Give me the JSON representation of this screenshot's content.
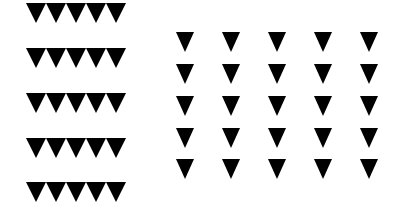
{
  "figure": {
    "background": "#ffffff",
    "shape": "downward-triangle",
    "shape_color": "#000000",
    "left_group": {
      "rows": 5,
      "per_row": 5,
      "arrangement": "tightly packed rows",
      "x_start": 26,
      "triangle_width": 20,
      "triangle_height": 20,
      "row_tops": [
        3,
        48,
        93,
        138,
        182
      ]
    },
    "right_grid": {
      "rows": 5,
      "cols": 5,
      "arrangement": "evenly spaced grid",
      "col_centers": [
        185,
        231,
        277,
        323,
        369
      ],
      "row_tops": [
        32,
        64,
        96,
        128,
        159
      ],
      "triangle_width": 18,
      "triangle_height": 20
    }
  }
}
